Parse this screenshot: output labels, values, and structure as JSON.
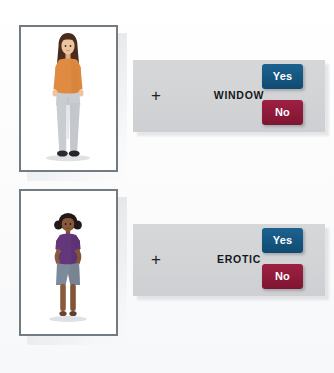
{
  "task": {
    "type": "word-image-association-task",
    "background_color": "#fdfdfd"
  },
  "trials": [
    {
      "id": "trial-1",
      "word": "WINDOW",
      "fixation": "+",
      "image": {
        "name": "adult-woman-standing-figure",
        "description": "Adult woman standing, long dark brown hair, orange long-sleeve top, light gray jeans, dark shoes",
        "skin": "#e8bb94",
        "hair": "#4a2c1e",
        "top": "#e08b42",
        "bottom": "#c9cdd2",
        "shoes": "#2b2b30"
      },
      "buttons": [
        {
          "name": "yes-button",
          "label": "Yes",
          "color": "#15567f"
        },
        {
          "name": "no-button",
          "label": "No",
          "color": "#8e1a3a"
        }
      ]
    },
    {
      "id": "trial-2",
      "word": "EROTIC",
      "fixation": "+",
      "image": {
        "name": "child-girl-standing-figure",
        "description": "Young dark-skinned girl standing with hands on hips, black hair in pigtails, purple t-shirt, blue-gray shorts",
        "skin": "#8a5a3c",
        "hair": "#211a18",
        "top": "#63377a",
        "bottom": "#7d8a99",
        "shoes": "#6b452f"
      },
      "buttons": [
        {
          "name": "yes-button",
          "label": "Yes",
          "color": "#15567f"
        },
        {
          "name": "no-button",
          "label": "No",
          "color": "#8e1a3a"
        }
      ]
    }
  ],
  "colors": {
    "panel": "#d2d4d6",
    "frame_border": "#737b82",
    "word_text": "#14181c",
    "button_text": "#ffffff"
  }
}
